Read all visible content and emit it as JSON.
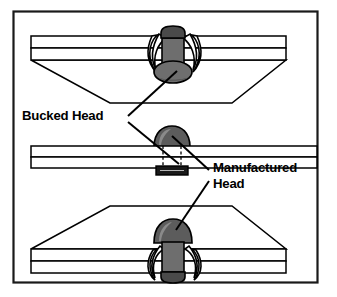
{
  "figure": {
    "border": {
      "color": "#1a1a1a",
      "background": "#ffffff"
    }
  },
  "labels": [
    {
      "id": "bucked-head",
      "text": "Bucked Head",
      "x": 22,
      "y": 120,
      "lines": [
        "Bucked Head"
      ]
    },
    {
      "id": "manufactured-head",
      "text": "Manufactured Head",
      "x": 212,
      "y": 172,
      "lines": [
        "Manufactured",
        "Head"
      ]
    }
  ],
  "views": [
    {
      "id": "top-view",
      "caption": "Upper joint, rivet viewed from below with bucked head exposed",
      "rivet_head_type": "bucked",
      "head_shape": "flattened-upset"
    },
    {
      "id": "middle-view",
      "caption": "Flat plate cross-section with hidden rivet shank shown dashed",
      "rivet_head_type": "manufactured",
      "head_shape": "dome"
    },
    {
      "id": "bottom-view",
      "caption": "Lower joint, rivet viewed from above with manufactured head exposed",
      "rivet_head_type": "manufactured",
      "head_shape": "dome"
    }
  ],
  "colors": {
    "outline": "#000000",
    "plate_fill": "#ffffff",
    "rivet_fill": "#6e6e6e",
    "rivet_fill_dark": "#4a4a4a",
    "rivet_fill_light": "#8a8a8a",
    "wing_fill": "#ffffff",
    "tail_fill": "#1a1a1a",
    "leader": "#000000"
  },
  "leaders": [
    {
      "id": "bucked-to-top-rivet",
      "from": [
        128,
        116
      ],
      "to": [
        176,
        70
      ]
    },
    {
      "id": "bucked-to-middle-tail",
      "from": [
        128,
        122
      ],
      "to": [
        178,
        163
      ]
    },
    {
      "id": "manufactured-to-middle-head",
      "from": [
        208,
        172
      ],
      "to": [
        171,
        138
      ]
    },
    {
      "id": "manufactured-to-bottom-head",
      "from": [
        208,
        182
      ],
      "to": [
        175,
        231
      ]
    }
  ]
}
